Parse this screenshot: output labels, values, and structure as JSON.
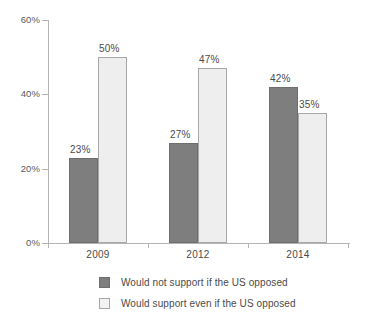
{
  "chart_data": {
    "type": "bar",
    "title": "",
    "subtitle": "",
    "xlabel": "",
    "ylabel": "",
    "categories": [
      "2009",
      "2012",
      "2014"
    ],
    "series": [
      {
        "name": "Would not support if the US opposed",
        "color": "#7e7e7e",
        "values": [
          23,
          27,
          42
        ],
        "labels": [
          "23%",
          "27%",
          "42%"
        ]
      },
      {
        "name": "Would support even if the US opposed",
        "color": "#eeeeee",
        "values": [
          50,
          47,
          35
        ],
        "labels": [
          "50%",
          "47%",
          "35%"
        ]
      }
    ],
    "ylim": [
      0,
      60
    ],
    "y_ticks": [
      0,
      20,
      40,
      60
    ],
    "y_tick_labels": [
      "0%",
      "20%",
      "40%",
      "60%"
    ],
    "grid": false,
    "legend_position": "bottom"
  },
  "axes": {
    "y_ticks": [
      {
        "value": 60,
        "label": "60%"
      },
      {
        "value": 40,
        "label": "40%"
      },
      {
        "value": 20,
        "label": "20%"
      },
      {
        "value": 0,
        "label": "0%"
      }
    ],
    "x_categories": [
      {
        "label": "2009"
      },
      {
        "label": "2012"
      },
      {
        "label": "2014"
      }
    ]
  },
  "bars": [
    {
      "label": "23%"
    },
    {
      "label": "50%"
    },
    {
      "label": "27%"
    },
    {
      "label": "47%"
    },
    {
      "label": "42%"
    },
    {
      "label": "35%"
    }
  ],
  "legend": {
    "items": [
      {
        "label": "Would not support if the US opposed",
        "color": "#7e7e7e"
      },
      {
        "label": "Would support even if the US opposed",
        "color": "#eeeeee"
      }
    ]
  }
}
